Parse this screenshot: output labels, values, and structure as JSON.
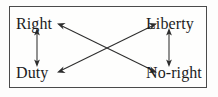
{
  "figure": {
    "background_color": "#fdfdfc",
    "border_color": "#4a4a4a",
    "ink_color": "#2e2e2e",
    "text_color": "#1c1c1c"
  },
  "nodes": [
    {
      "id": "right",
      "label": "Right",
      "position": "top-left"
    },
    {
      "id": "liberty",
      "label": "Liberty",
      "position": "top-right"
    },
    {
      "id": "duty",
      "label": "Duty",
      "position": "bottom-left"
    },
    {
      "id": "no-right",
      "label": "No-right",
      "position": "bottom-right"
    }
  ],
  "edges": [
    {
      "id": "right-duty",
      "from": "right",
      "to": "duty",
      "style": "double-headed",
      "orientation": "vertical"
    },
    {
      "id": "liberty-noright",
      "from": "liberty",
      "to": "no-right",
      "style": "double-headed",
      "orientation": "vertical"
    },
    {
      "id": "right-noright",
      "from": "right",
      "to": "no-right",
      "style": "double-headed",
      "orientation": "diagonal"
    },
    {
      "id": "duty-liberty",
      "from": "duty",
      "to": "liberty",
      "style": "double-headed",
      "orientation": "diagonal"
    }
  ]
}
